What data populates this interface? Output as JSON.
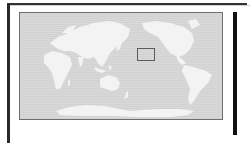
{
  "window": {
    "title": ""
  },
  "map": {
    "projection": "pacific-centered world map",
    "ocean_color": "#d6d6d6",
    "land_color": "#f4f4f4",
    "border_color": "#6e6e6e",
    "selection": {
      "label": "",
      "border_color": "#5a5a5a"
    }
  },
  "colors": {
    "frame": "#2a2a2a",
    "right_bar": "#111111",
    "background": "#ffffff"
  }
}
